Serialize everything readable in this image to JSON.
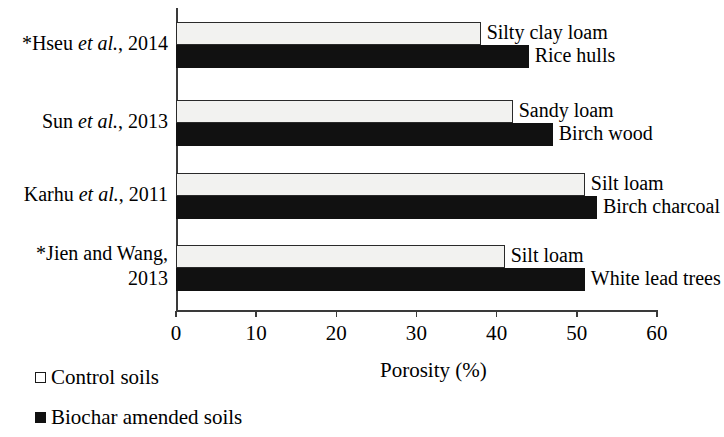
{
  "chart_data": {
    "type": "bar",
    "orientation": "horizontal",
    "title": "",
    "xlabel": "Porosity (%)",
    "ylabel": "",
    "xlim": [
      0,
      60
    ],
    "xticks": [
      0,
      10,
      20,
      30,
      40,
      50,
      60
    ],
    "xtick_labels": [
      "0",
      "10",
      "20",
      "30",
      "40",
      "50",
      "60"
    ],
    "grid": false,
    "legend_position": "below-left",
    "categories": [
      "*Hseu et al., 2014",
      "Sun et al., 2013",
      "Karhu et al., 2011",
      "*Jien and Wang, 2013"
    ],
    "series": [
      {
        "name": "Control soils",
        "color": "#f2f2f0",
        "values": [
          38,
          42,
          51,
          41
        ],
        "point_labels": [
          "Silty clay loam",
          "Sandy loam",
          "Silt loam",
          "Silt loam"
        ]
      },
      {
        "name": "Biochar amended soils",
        "color": "#111111",
        "values": [
          44,
          47,
          52.5,
          51
        ],
        "point_labels": [
          "Rice hulls",
          "Birch wood",
          "Birch charcoal",
          "White lead trees"
        ]
      }
    ]
  },
  "axis": {
    "x_title": "Porosity (%)",
    "tick_labels": [
      "0",
      "10",
      "20",
      "30",
      "40",
      "50",
      "60"
    ]
  },
  "categories": [
    {
      "prefix": "*",
      "author": "Hseu ",
      "etal": "et al.",
      "year": ", 2014",
      "line2": ""
    },
    {
      "prefix": "",
      "author": "Sun ",
      "etal": "et al.",
      "year": ", 2013",
      "line2": ""
    },
    {
      "prefix": "",
      "author": "Karhu ",
      "etal": "et al.",
      "year": ", 2011",
      "line2": ""
    },
    {
      "prefix": "*",
      "author": "Jien and Wang,",
      "etal": "",
      "year": "",
      "line2": "2013"
    }
  ],
  "bar_labels": {
    "control": [
      "Silty clay loam",
      "Sandy loam",
      "Silt loam",
      "Silt loam"
    ],
    "biochar": [
      "Rice hulls",
      "Birch wood",
      "Birch charcoal",
      "White lead trees"
    ]
  },
  "legend": {
    "control_label": "Control soils",
    "biochar_label": "Biochar amended soils"
  },
  "colors": {
    "control_fill": "#f2f2f0",
    "control_stroke": "#2a2a2a",
    "biochar_fill": "#111111",
    "axis": "#3a3a3a",
    "text": "#000000"
  }
}
